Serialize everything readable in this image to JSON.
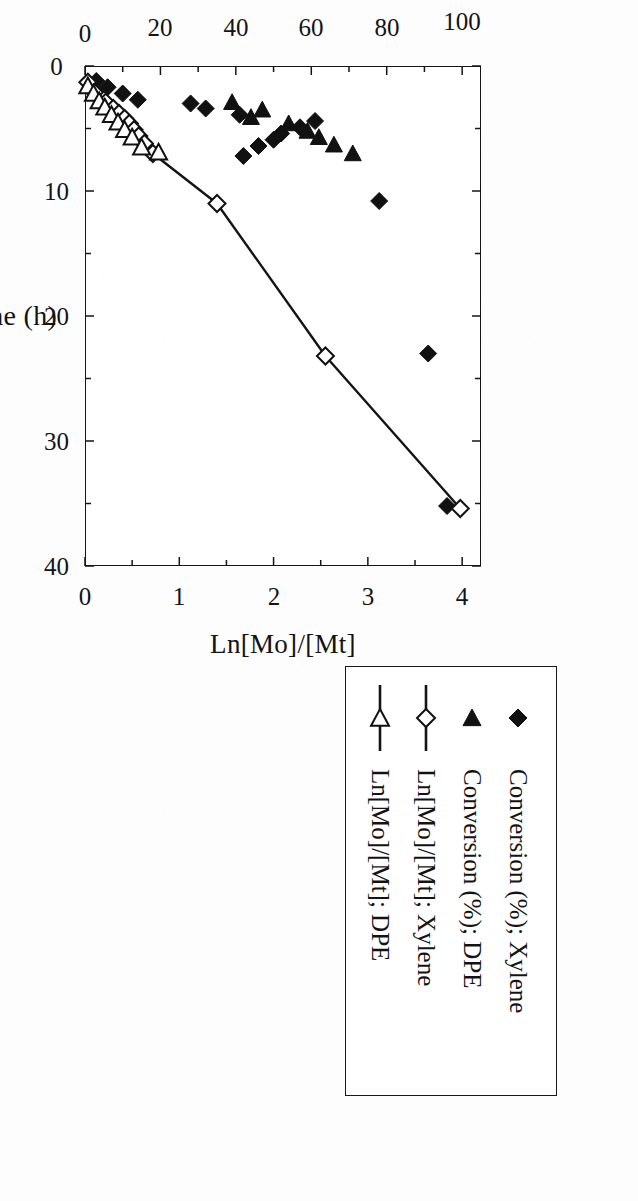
{
  "figure": {
    "x_axis": {
      "title": "Time (h)",
      "ticks": [
        0,
        10,
        20,
        30,
        40
      ],
      "tick_labels": [
        "0",
        "10",
        "20",
        "30",
        "40"
      ],
      "min": 0,
      "max": 40
    },
    "y_axis_left": {
      "title": "Conversion (%)",
      "ticks": [
        0,
        20,
        40,
        60,
        80,
        100
      ],
      "tick_labels": [
        "0",
        "20",
        "40",
        "60",
        "80",
        "100"
      ],
      "min": 0,
      "max": 105
    },
    "y_axis_right": {
      "title": "Ln[Mo]/[Mt]",
      "ticks": [
        0,
        1,
        2,
        3,
        4
      ],
      "tick_labels": [
        "0",
        "1",
        "2",
        "3",
        "4"
      ],
      "min": 0,
      "max": 4.2
    },
    "legend": {
      "items": [
        {
          "label": "Conversion (%); Xylene",
          "marker": "filled-diamond",
          "line": false
        },
        {
          "label": "Conversion (%); DPE",
          "marker": "filled-triangle",
          "line": false
        },
        {
          "label": "Ln[Mo]/[Mt]; Xylene",
          "marker": "open-diamond",
          "line": true
        },
        {
          "label": "Ln[Mo]/[Mt]; DPE",
          "marker": "open-triangle",
          "line": true
        }
      ]
    }
  },
  "chart_data": {
    "type": "scatter",
    "title": "",
    "xlabel": "Time (h)",
    "ylabel": "Conversion (%)",
    "ylabel_secondary": "Ln[Mo]/[Mt]",
    "xlim": [
      0,
      40
    ],
    "ylim": [
      0,
      105
    ],
    "ylim_secondary": [
      0,
      4.2
    ],
    "grid": false,
    "legend_position": "right",
    "rotation_note": "figure printed rotated 90 degrees clockwise on the page",
    "series": [
      {
        "name": "Conversion (%); Xylene",
        "axis": "left",
        "marker": "filled-diamond",
        "line": false,
        "points": [
          [
            1.2,
            3
          ],
          [
            1.7,
            6
          ],
          [
            2.2,
            10
          ],
          [
            2.7,
            14
          ],
          [
            3.0,
            28
          ],
          [
            3.4,
            32
          ],
          [
            3.9,
            41
          ],
          [
            4.4,
            61
          ],
          [
            4.9,
            57
          ],
          [
            5.4,
            52
          ],
          [
            5.9,
            50
          ],
          [
            6.4,
            46
          ],
          [
            7.2,
            42
          ],
          [
            10.8,
            78
          ],
          [
            23.0,
            91
          ],
          [
            35.2,
            96
          ]
        ]
      },
      {
        "name": "Conversion (%); DPE",
        "axis": "left",
        "marker": "filled-triangle",
        "line": false,
        "points": [
          [
            2.9,
            39
          ],
          [
            3.5,
            47
          ],
          [
            4.1,
            44
          ],
          [
            4.6,
            54
          ],
          [
            5.2,
            59
          ],
          [
            5.7,
            62
          ],
          [
            6.3,
            66
          ],
          [
            7.0,
            71
          ]
        ]
      },
      {
        "name": "Ln[Mo]/[Mt]; Xylene",
        "axis": "right",
        "marker": "open-diamond",
        "line": true,
        "points": [
          [
            1.3,
            0.03
          ],
          [
            2.1,
            0.1
          ],
          [
            2.9,
            0.22
          ],
          [
            3.4,
            0.3
          ],
          [
            3.8,
            0.36
          ],
          [
            4.2,
            0.42
          ],
          [
            4.6,
            0.47
          ],
          [
            5.1,
            0.52
          ],
          [
            5.6,
            0.57
          ],
          [
            6.2,
            0.63
          ],
          [
            7.0,
            0.72
          ],
          [
            11.0,
            1.4
          ],
          [
            23.2,
            2.55
          ],
          [
            35.4,
            3.98
          ]
        ]
      },
      {
        "name": "Ln[Mo]/[Mt]; DPE",
        "axis": "right",
        "marker": "open-triangle",
        "line": true,
        "points": [
          [
            1.6,
            0.03
          ],
          [
            2.2,
            0.09
          ],
          [
            2.8,
            0.15
          ],
          [
            3.3,
            0.21
          ],
          [
            3.9,
            0.28
          ],
          [
            4.5,
            0.35
          ],
          [
            5.1,
            0.42
          ],
          [
            5.7,
            0.5
          ],
          [
            6.5,
            0.6
          ],
          [
            6.9,
            0.78
          ]
        ]
      }
    ]
  }
}
